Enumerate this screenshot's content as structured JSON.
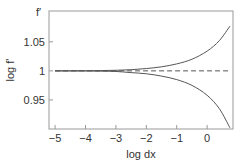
{
  "chart_data": {
    "type": "line",
    "title": "",
    "corner_label": "f′",
    "xlabel": "log dx",
    "ylabel": "log f'",
    "xlim": [
      -5.2,
      0.85
    ],
    "ylim": [
      0.9,
      1.103
    ],
    "x_ticks": [
      -5,
      -4,
      -3,
      -2,
      -1,
      0
    ],
    "x_tick_labels": [
      "−5",
      "−4",
      "−3",
      "−2",
      "−1",
      "0"
    ],
    "y_ticks": [
      0.95,
      1,
      1.05
    ],
    "y_tick_labels": [
      "0.95",
      "1",
      "1.05"
    ],
    "grid": false,
    "legend": null,
    "series": [
      {
        "name": "upper",
        "style": "solid",
        "x": [
          -5,
          -4.5,
          -4,
          -3.5,
          -3,
          -2.5,
          -2,
          -1.5,
          -1,
          -0.5,
          0,
          0.4,
          0.75
        ],
        "y": [
          1.0,
          1.0,
          1.0,
          1.0005,
          1.001,
          1.002,
          1.004,
          1.007,
          1.012,
          1.02,
          1.034,
          1.052,
          1.077
        ]
      },
      {
        "name": "lower",
        "style": "solid",
        "x": [
          -5,
          -4.5,
          -4,
          -3.5,
          -3,
          -2.5,
          -2,
          -1.5,
          -1,
          -0.5,
          0,
          0.4,
          0.75
        ],
        "y": [
          1.0,
          1.0,
          1.0,
          0.9995,
          0.999,
          0.997,
          0.995,
          0.991,
          0.985,
          0.975,
          0.958,
          0.935,
          0.902
        ]
      },
      {
        "name": "reference",
        "style": "dashed",
        "x": [
          -5,
          0.75
        ],
        "y": [
          1.0,
          1.0
        ]
      }
    ]
  },
  "colors": {
    "line": "#555555",
    "frame": "#888888",
    "text": "#333333"
  }
}
